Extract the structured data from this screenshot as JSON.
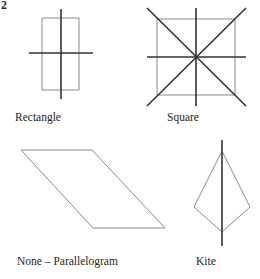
{
  "page": {
    "question_number": "2",
    "background_color": "#ffffff",
    "width": 260,
    "height": 279
  },
  "style": {
    "shape_outline_color": "#8a8a8a",
    "symmetry_line_color": "#333333",
    "text_color": "#262626",
    "shape_stroke_width": 1,
    "symmetry_stroke_width": 1.6
  },
  "figures": [
    {
      "id": "rectangle",
      "label": "Rectangle",
      "label_position": {
        "x": 15,
        "y": 111
      },
      "symmetry_line_count": 2,
      "symmetry_line_types": [
        "vertical",
        "horizontal"
      ],
      "outline_points": "42,18 79,18 79,90 42,90",
      "symmetry_lines": [
        {
          "name": "vertical-axis",
          "x1": 61,
          "y1": 9,
          "x2": 61,
          "y2": 99
        },
        {
          "name": "horizontal-axis",
          "x1": 29,
          "y1": 53,
          "x2": 93,
          "y2": 53
        }
      ]
    },
    {
      "id": "square",
      "label": "Square",
      "label_position": {
        "x": 167,
        "y": 111
      },
      "symmetry_line_count": 4,
      "symmetry_line_types": [
        "vertical",
        "horizontal",
        "diagonal-nwse",
        "diagonal-nesw"
      ],
      "outline_points": "157,19 235,19 235,95 157,95",
      "symmetry_lines": [
        {
          "name": "vertical-axis",
          "x1": 196,
          "y1": 8,
          "x2": 196,
          "y2": 106
        },
        {
          "name": "horizontal-axis",
          "x1": 147,
          "y1": 57,
          "x2": 246,
          "y2": 57
        },
        {
          "name": "diagonal-nwse",
          "x1": 147,
          "y1": 8,
          "x2": 246,
          "y2": 106
        },
        {
          "name": "diagonal-nesw",
          "x1": 246,
          "y1": 8,
          "x2": 147,
          "y2": 106
        }
      ]
    },
    {
      "id": "parallelogram",
      "label": "None – Parallelogram",
      "label_position": {
        "x": 17,
        "y": 255
      },
      "symmetry_line_count": 0,
      "symmetry_line_types": [],
      "outline_points": "21,150 92,150 165,228 93,228",
      "symmetry_lines": []
    },
    {
      "id": "kite",
      "label": "Kite",
      "label_position": {
        "x": 196,
        "y": 255
      },
      "symmetry_line_count": 1,
      "symmetry_line_types": [
        "vertical"
      ],
      "outline_points": "222,151 250,207 222,232 194,207",
      "symmetry_lines": [
        {
          "name": "vertical-axis",
          "x1": 222,
          "y1": 140,
          "x2": 222,
          "y2": 246
        }
      ]
    }
  ]
}
